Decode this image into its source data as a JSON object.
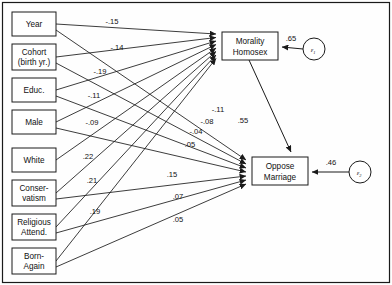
{
  "diagram": {
    "type": "path-diagram",
    "frame_color": "#1a1a1a",
    "background": "#fefefe",
    "predictors": [
      {
        "id": "year",
        "lines": [
          "Year"
        ],
        "x": 12,
        "y": 12,
        "w": 44,
        "h": 24
      },
      {
        "id": "cohort",
        "lines": [
          "Cohort",
          "(birth yr.)"
        ],
        "x": 12,
        "y": 44,
        "w": 44,
        "h": 26
      },
      {
        "id": "educ",
        "lines": [
          "Educ."
        ],
        "x": 12,
        "y": 78,
        "w": 44,
        "h": 24
      },
      {
        "id": "male",
        "lines": [
          "Male"
        ],
        "x": 12,
        "y": 110,
        "w": 44,
        "h": 24
      },
      {
        "id": "white",
        "lines": [
          "White"
        ],
        "x": 12,
        "y": 148,
        "w": 44,
        "h": 24
      },
      {
        "id": "conservatism",
        "lines": [
          "Conser-",
          "vatism"
        ],
        "x": 12,
        "y": 180,
        "w": 44,
        "h": 26
      },
      {
        "id": "relattend",
        "lines": [
          "Religious",
          "Attend."
        ],
        "x": 12,
        "y": 214,
        "w": 44,
        "h": 26
      },
      {
        "id": "bornagain",
        "lines": [
          "Born-",
          "Again"
        ],
        "x": 12,
        "y": 248,
        "w": 44,
        "h": 26
      }
    ],
    "outcomes": [
      {
        "id": "morality",
        "lines": [
          "Morality",
          "Homosex"
        ],
        "x": 222,
        "y": 32,
        "w": 56,
        "h": 28
      },
      {
        "id": "oppose",
        "lines": [
          "Oppose",
          "Marriage"
        ],
        "x": 252,
        "y": 157,
        "w": 56,
        "h": 28
      }
    ],
    "errors": [
      {
        "id": "e1",
        "symbol": "ε",
        "subscript": "1",
        "cx": 314,
        "cy": 49,
        "r": 11,
        "coefficient": ".65"
      },
      {
        "id": "e2",
        "symbol": "ε",
        "subscript": "2",
        "cx": 360,
        "cy": 172,
        "r": 11,
        "coefficient": ".46"
      }
    ],
    "paths_to_morality": [
      {
        "from": "year",
        "coefficient": "-.15",
        "label_x": 112,
        "label_y": 24
      },
      {
        "from": "cohort",
        "coefficient": "-.14",
        "label_x": 117,
        "label_y": 50
      },
      {
        "from": "educ",
        "coefficient": "-.19",
        "label_x": 100,
        "label_y": 74
      },
      {
        "from": "male",
        "coefficient": "-.11",
        "label_x": 94,
        "label_y": 98
      },
      {
        "from": "white",
        "coefficient": "-.09",
        "label_x": 92,
        "label_y": 125
      },
      {
        "from": "conservatism",
        "coefficient": ".22",
        "label_x": 88,
        "label_y": 159
      },
      {
        "from": "relattend",
        "coefficient": ".21",
        "label_x": 92,
        "label_y": 183
      },
      {
        "from": "bornagain",
        "coefficient": ".19",
        "label_x": 95,
        "label_y": 214
      }
    ],
    "paths_to_oppose": [
      {
        "from": "year",
        "coefficient": "-.11",
        "label_x": 218,
        "label_y": 112
      },
      {
        "from": "cohort",
        "coefficient": "-.08",
        "label_x": 207,
        "label_y": 124
      },
      {
        "from": "educ",
        "coefficient": "-.04",
        "label_x": 196,
        "label_y": 134
      },
      {
        "from": "male",
        "coefficient": ".05",
        "label_x": 190,
        "label_y": 147
      },
      {
        "from": "conservatism",
        "coefficient": ".15",
        "label_x": 172,
        "label_y": 177
      },
      {
        "from": "relattend",
        "coefficient": ".07",
        "label_x": 178,
        "label_y": 199
      },
      {
        "from": "bornagain",
        "coefficient": ".05",
        "label_x": 178,
        "label_y": 222
      }
    ],
    "structural_path": {
      "from": "morality",
      "to": "oppose",
      "coefficient": ".55",
      "label_x": 243,
      "label_y": 123
    }
  }
}
